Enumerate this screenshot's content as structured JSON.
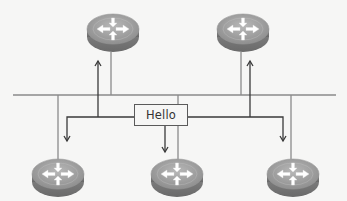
{
  "diagram": {
    "packet": {
      "label": "Hello"
    },
    "colors": {
      "background": "#f6f6f5",
      "bus_line": "#8a8a8a",
      "arrow_line": "#3a3a3a",
      "router_body": "#8c8c8c",
      "router_top": "#a9a9a9",
      "router_arrows": "#ffffff"
    },
    "nodes": [
      {
        "id": "router-top-left",
        "type": "router",
        "icon": "router-icon",
        "row": "top",
        "receives_hello": true
      },
      {
        "id": "router-top-right",
        "type": "router",
        "icon": "router-icon",
        "row": "top",
        "receives_hello": true
      },
      {
        "id": "router-bottom-left",
        "type": "router",
        "icon": "router-icon",
        "row": "bottom",
        "receives_hello": true
      },
      {
        "id": "router-bottom-center",
        "type": "router",
        "icon": "router-icon",
        "row": "bottom",
        "sends_hello": true
      },
      {
        "id": "router-bottom-right",
        "type": "router",
        "icon": "router-icon",
        "row": "bottom",
        "receives_hello": true
      }
    ],
    "links": [
      {
        "type": "shared-bus",
        "connects": [
          "router-top-left",
          "router-top-right",
          "router-bottom-left",
          "router-bottom-center",
          "router-bottom-right"
        ]
      }
    ],
    "flows": [
      {
        "from": "router-bottom-center",
        "to": "router-top-left",
        "label": "Hello"
      },
      {
        "from": "router-bottom-center",
        "to": "router-top-right",
        "label": "Hello"
      },
      {
        "from": "router-bottom-center",
        "to": "router-bottom-left",
        "label": "Hello"
      },
      {
        "from": "router-bottom-center",
        "to": "router-bottom-right",
        "label": "Hello"
      }
    ]
  }
}
